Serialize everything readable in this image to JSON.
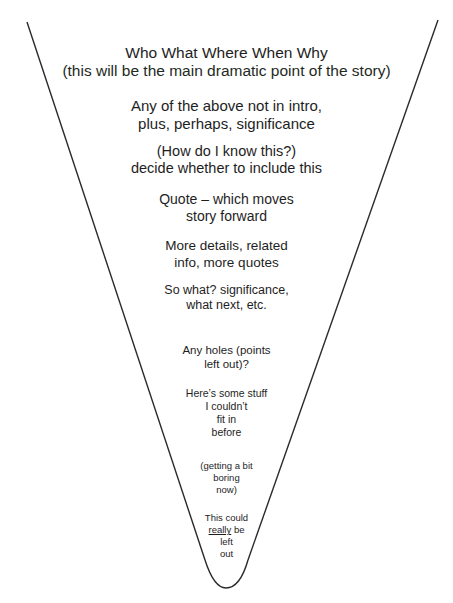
{
  "diagram": {
    "type": "inverted-pyramid",
    "line_color": "#2a2a2a",
    "blocks": [
      {
        "lines": [
          "Who What Where When Why",
          "(this will be the main dramatic point of the story)"
        ]
      },
      {
        "lines": [
          "Any of the above not in intro,",
          "plus, perhaps, significance"
        ]
      },
      {
        "lines": [
          "(How do I know this?)",
          "decide whether to include this"
        ]
      },
      {
        "lines": [
          "Quote – which moves",
          "story forward"
        ]
      },
      {
        "lines": [
          "More details, related",
          "info, more quotes"
        ]
      },
      {
        "lines": [
          "So what? significance,",
          "what next, etc."
        ]
      },
      {
        "lines": [
          "Any holes (points",
          "left out)?"
        ]
      },
      {
        "lines": [
          "Here’s some stuff",
          "I couldn’t",
          "fit in",
          "before"
        ]
      },
      {
        "lines": [
          "(getting a bit",
          "boring",
          "now)"
        ]
      },
      {
        "lines": [
          "This could",
          "be",
          "left",
          "out"
        ],
        "underlined_word": "really"
      }
    ]
  }
}
